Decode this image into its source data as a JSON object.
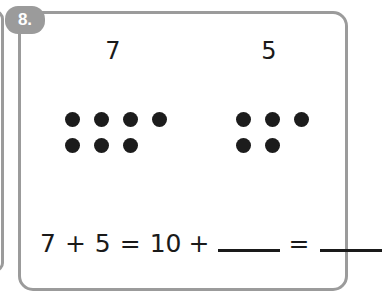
{
  "problem": {
    "number_label": "8.",
    "addends": [
      {
        "value": "7",
        "dot_count": 7
      },
      {
        "value": "5",
        "dot_count": 5
      }
    ],
    "dot_groups": [
      {
        "name": "left-dot-group",
        "rows": [
          4,
          3
        ],
        "total": 7
      },
      {
        "name": "right-dot-group",
        "rows": [
          3,
          2
        ],
        "total": 5
      }
    ],
    "equation": {
      "tokens": [
        "7",
        "+",
        "5",
        "=",
        "10",
        "+"
      ],
      "first_blank": "",
      "equals_sign": "=",
      "second_blank": "",
      "full_text": "7 + 5 = 10 + ____ = ____"
    }
  },
  "colors": {
    "frame": "#9b9b9b",
    "badge_background": "#9b9b9b",
    "badge_text": "#ffffff",
    "dot": "#1c1c1c",
    "text": "#1a1a1a",
    "page_background": "#ffffff"
  }
}
